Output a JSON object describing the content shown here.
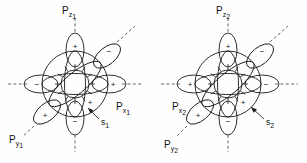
{
  "figure": {
    "background_color": "#fefefe",
    "stroke_color": "#1a1a1a",
    "axis_color": "#555555",
    "width": 307,
    "height": 163
  },
  "diagrams": [
    {
      "id": "left",
      "center": {
        "x": 75,
        "y": 84
      },
      "labels": {
        "pz": {
          "base": "P",
          "sub_main": "z",
          "sub_index": "1",
          "x": 62,
          "y": 13
        },
        "px": {
          "base": "P",
          "sub_main": "x",
          "sub_index": "1",
          "x": 116,
          "y": 109
        },
        "py": {
          "base": "P",
          "sub_main": "y",
          "sub_index": "1",
          "x": 9,
          "y": 142
        },
        "s": {
          "base": "s",
          "sub_index": "1",
          "x": 101,
          "y": 124
        }
      },
      "lobes": [
        {
          "name": "pz-up",
          "sign": "+",
          "angle_deg": 90,
          "sign_x": 75,
          "sign_y": 46
        },
        {
          "name": "pz-down",
          "sign": "−",
          "angle_deg": 270,
          "sign_x": 75,
          "sign_y": 124
        },
        {
          "name": "px-right",
          "sign": "+",
          "angle_deg": 0,
          "sign_x": 113,
          "sign_y": 84
        },
        {
          "name": "px-left",
          "sign": "−",
          "angle_deg": 180,
          "sign_x": 37,
          "sign_y": 84
        },
        {
          "name": "py-upright",
          "sign": "−",
          "angle_deg": 35,
          "sign_x": 110,
          "sign_y": 51
        },
        {
          "name": "py-downleft",
          "sign": "+",
          "angle_deg": 215,
          "sign_x": 44,
          "sign_y": 117
        },
        {
          "name": "inner-plus",
          "sign": "+",
          "angle_deg": 330,
          "sign_x": 88,
          "sign_y": 104
        }
      ]
    },
    {
      "id": "right",
      "center": {
        "x": 228,
        "y": 84
      },
      "labels": {
        "pz": {
          "base": "P",
          "sub_main": "z",
          "sub_index": "2",
          "x": 216,
          "y": 13
        },
        "px": {
          "base": "P",
          "sub_main": "x",
          "sub_index": "2",
          "x": 173,
          "y": 109
        },
        "py": {
          "base": "P",
          "sub_main": "y",
          "sub_index": "2",
          "x": 165,
          "y": 147
        },
        "s": {
          "base": "s",
          "sub_index": "2",
          "x": 266,
          "y": 124
        }
      },
      "lobes": [
        {
          "name": "pz-up",
          "sign": "+",
          "angle_deg": 90,
          "sign_x": 228,
          "sign_y": 46
        },
        {
          "name": "pz-down",
          "sign": "−",
          "angle_deg": 270,
          "sign_x": 228,
          "sign_y": 124
        },
        {
          "name": "px-right",
          "sign": "−",
          "angle_deg": 0,
          "sign_x": 266,
          "sign_y": 84
        },
        {
          "name": "px-left",
          "sign": "+",
          "angle_deg": 180,
          "sign_x": 190,
          "sign_y": 84
        },
        {
          "name": "py-upright",
          "sign": "−",
          "angle_deg": 35,
          "sign_x": 263,
          "sign_y": 51
        },
        {
          "name": "py-downleft",
          "sign": "+",
          "angle_deg": 215,
          "sign_x": 197,
          "sign_y": 117
        },
        {
          "name": "inner-plus",
          "sign": "+",
          "angle_deg": 330,
          "sign_x": 241,
          "sign_y": 104
        }
      ]
    }
  ]
}
